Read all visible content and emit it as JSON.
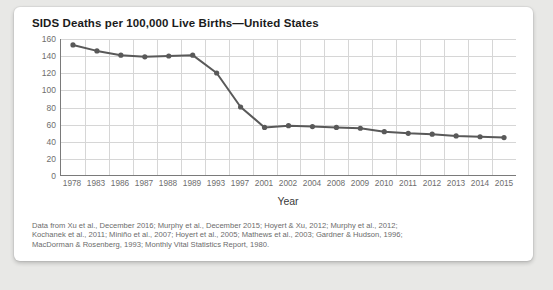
{
  "card": {
    "title": "SIDS Deaths per 100,000 Live Births—United States"
  },
  "caption": {
    "line1": "Data from Xu et al., December 2016; Murphy et al., December 2015; Hoyert & Xu, 2012; Murphy et al., 2012;",
    "line2": "Kochanek et al., 2011; Miniño et al., 2007; Hoyert et al., 2005; Mathews et al., 2003; Gardner & Hudson, 1996;",
    "line3": "MacDorman & Rosenberg, 1993; Monthly Vital Statistics Report, 1980."
  },
  "colors": {
    "line": "#595959",
    "marker": "#595959",
    "grid": "#d6d6d6",
    "axis": "#7a7a7a",
    "tick_text": "#6e6e6e",
    "card_background": "#ffffff",
    "page_background": "#e8e8e6"
  },
  "chart_data": {
    "type": "line",
    "title": "SIDS Deaths per 100,000 Live Births—United States",
    "xlabel": "Year",
    "ylabel": "",
    "categories": [
      "1978",
      "1983",
      "1986",
      "1987",
      "1988",
      "1989",
      "1993",
      "1997",
      "2001",
      "2002",
      "2004",
      "2008",
      "2009",
      "2010",
      "2011",
      "2012",
      "2013",
      "2014",
      "2015"
    ],
    "values": [
      153,
      146,
      141,
      139,
      140,
      141,
      120,
      80,
      56,
      58,
      57,
      56,
      55,
      51,
      49,
      48,
      46,
      45,
      44
    ],
    "yticks": [
      0,
      20,
      40,
      60,
      80,
      100,
      120,
      140,
      160
    ],
    "ylim": [
      0,
      160
    ],
    "grid": true,
    "legend": false,
    "markers": true
  }
}
